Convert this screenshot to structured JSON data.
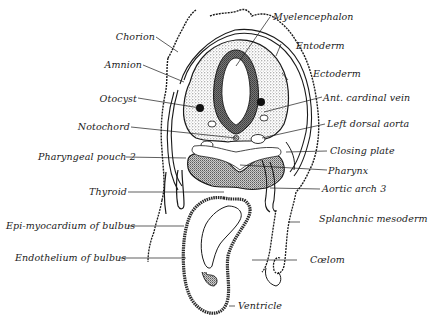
{
  "figure": {
    "colors": {
      "ink": "#1a1a1a",
      "stipple": "#6b6b6b",
      "paper": "#ffffff"
    },
    "labels_left": [
      {
        "id": "chorion",
        "text": "Chorion"
      },
      {
        "id": "amnion",
        "text": "Amnion"
      },
      {
        "id": "otocyst",
        "text": "Otocyst"
      },
      {
        "id": "notochord",
        "text": "Notochord"
      },
      {
        "id": "pharyngeal-pouch-2",
        "text": "Pharyngeal pouch 2"
      },
      {
        "id": "thyroid",
        "text": "Thyroid"
      },
      {
        "id": "epi-myocardium",
        "text": "Epi-myocardium of bulbus"
      },
      {
        "id": "endothelium",
        "text": "Endothelium of bulbus"
      }
    ],
    "labels_right": [
      {
        "id": "myelencephalon",
        "text": "Myelencephalon"
      },
      {
        "id": "entoderm",
        "text": "Entoderm"
      },
      {
        "id": "ectoderm",
        "text": "Ectoderm"
      },
      {
        "id": "ant-cardinal-vein",
        "text": "Ant. cardinal vein"
      },
      {
        "id": "left-dorsal-aorta",
        "text": "Left dorsal aorta"
      },
      {
        "id": "closing-plate",
        "text": "Closing plate"
      },
      {
        "id": "pharynx",
        "text": "Pharynx"
      },
      {
        "id": "aortic-arch-3",
        "text": "Aortic arch 3"
      },
      {
        "id": "splanchnic-mesoderm",
        "text": "Splanchnic mesoderm"
      },
      {
        "id": "coelom",
        "text": "Cœlom"
      },
      {
        "id": "ventricle",
        "text": "Ventricle"
      }
    ]
  }
}
